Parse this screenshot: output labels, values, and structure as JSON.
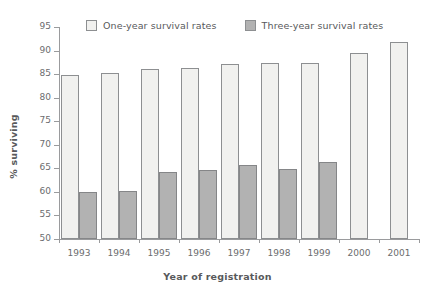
{
  "chart_data": {
    "type": "bar",
    "title": "",
    "xlabel": "Year of registration",
    "ylabel": "% surviving",
    "categories": [
      "1993",
      "1994",
      "1995",
      "1996",
      "1997",
      "1998",
      "1999",
      "2000",
      "2001"
    ],
    "series": [
      {
        "name": "One-year survival rates",
        "color": "#f1f1ef",
        "values": [
          84.9,
          85.2,
          86.1,
          86.3,
          87.2,
          87.4,
          87.3,
          89.5,
          91.9
        ]
      },
      {
        "name": "Three-year survival rates",
        "color": "#b2b2b2",
        "values": [
          59.9,
          60.1,
          64.2,
          64.6,
          65.7,
          64.8,
          66.4,
          null,
          null
        ]
      }
    ],
    "ylim": [
      50,
      95
    ],
    "ytick_step": 5,
    "yticks": [
      "95",
      "90",
      "85",
      "80",
      "75",
      "70",
      "65",
      "60",
      "55",
      "50"
    ],
    "grid": false,
    "legend_position": "top"
  },
  "legend": {
    "entries": [
      {
        "label": "One-year survival rates",
        "swatch": "light"
      },
      {
        "label": "Three-year survival rates",
        "swatch": "dark"
      }
    ]
  },
  "axes": {
    "y_title": "% surviving",
    "x_title": "Year of registration"
  },
  "colors": {
    "one_year_fill": "#f1f1ef",
    "three_year_fill": "#b2b2b2",
    "bar_stroke": "#8d8f91",
    "axis": "#9a9b9d",
    "text": "#58595b"
  }
}
